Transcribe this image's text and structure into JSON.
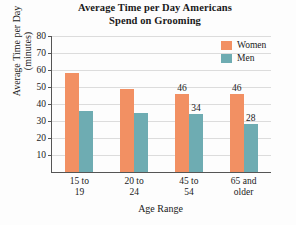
{
  "chart_data": {
    "type": "bar",
    "title": "Average Time per Day Americans Spend on Grooming",
    "title_line1": "Average Time per Day Americans",
    "title_line2": "Spend on Grooming",
    "xlabel": "Age Range",
    "ylabel": "Average Time per Day",
    "ylabel_line2": "(minutes)",
    "categories": [
      "15 to 19",
      "20 to 24",
      "45 to 54",
      "65 and older"
    ],
    "category_lines": [
      {
        "l1": "15 to",
        "l2": "19"
      },
      {
        "l1": "20 to",
        "l2": "24"
      },
      {
        "l1": "45 to",
        "l2": "54"
      },
      {
        "l1": "65 and",
        "l2": "older"
      }
    ],
    "series": [
      {
        "name": "Women",
        "color": "#F29063",
        "values": [
          58,
          49,
          46,
          46
        ],
        "labels": [
          "",
          "",
          "46",
          "46"
        ]
      },
      {
        "name": "Men",
        "color": "#6EACB2",
        "values": [
          36,
          35,
          34,
          28
        ],
        "labels": [
          "",
          "",
          "34",
          "28"
        ]
      }
    ],
    "ylim": [
      0,
      80
    ],
    "yticks": [
      10,
      20,
      30,
      40,
      50,
      60,
      70,
      80
    ],
    "ytick_labels": [
      "10",
      "20",
      "30",
      "40",
      "50",
      "60",
      "70",
      "80"
    ],
    "grid": true,
    "legend_position": "top-right",
    "legend_entries": [
      "Women",
      "Men"
    ]
  }
}
